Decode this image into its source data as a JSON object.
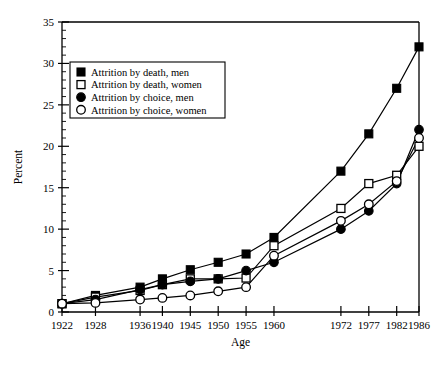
{
  "chart_data": {
    "type": "line",
    "title": "",
    "xlabel": "Age",
    "ylabel": "Percent",
    "grid": false,
    "legend_position": "upper-left-inside",
    "xlim": [
      1922,
      1986
    ],
    "ylim": [
      0,
      35
    ],
    "y_ticks_major": [
      0,
      5,
      10,
      15,
      20,
      25,
      30,
      35
    ],
    "y_tick_minor_step": 1,
    "categories": [
      1922,
      1928,
      1936,
      1940,
      1945,
      1950,
      1955,
      1960,
      1972,
      1977,
      1982,
      1986
    ],
    "x_tick_labels": [
      "1922",
      "1928",
      "1936",
      "1940",
      "1945",
      "1950",
      "1955",
      "1960",
      "1972",
      "1977",
      "1982",
      "1986"
    ],
    "series": [
      {
        "name": "Attrition by death, men",
        "marker": "filled-square",
        "values": [
          1.0,
          2.0,
          3.0,
          4.0,
          5.1,
          6.0,
          7.0,
          9.0,
          17.0,
          21.5,
          27.0,
          32.0
        ]
      },
      {
        "name": "Attrition by death, women",
        "marker": "open-square",
        "values": [
          1.0,
          1.8,
          2.6,
          3.3,
          4.0,
          4.0,
          4.1,
          8.0,
          12.5,
          15.5,
          16.5,
          20.0
        ]
      },
      {
        "name": "Attrition by choice, men",
        "marker": "filled-circle",
        "values": [
          1.0,
          1.5,
          2.7,
          3.3,
          3.7,
          4.0,
          5.0,
          6.0,
          10.0,
          12.2,
          15.5,
          22.0
        ]
      },
      {
        "name": "Attrition by choice, women",
        "marker": "open-circle",
        "values": [
          1.0,
          1.1,
          1.5,
          1.7,
          2.0,
          2.5,
          3.0,
          6.8,
          11.0,
          13.0,
          15.8,
          21.0
        ]
      }
    ]
  },
  "legend": {
    "entries": [
      {
        "label": "Attrition by death, men",
        "marker": "filled-square"
      },
      {
        "label": "Attrition by death, women",
        "marker": "open-square"
      },
      {
        "label": "Attrition by choice, men",
        "marker": "filled-circle"
      },
      {
        "label": "Attrition by choice, women",
        "marker": "open-circle"
      }
    ]
  },
  "axes": {
    "y_title": "Percent",
    "x_title": "Age",
    "y_tick_labels": [
      "0",
      "5",
      "10",
      "15",
      "20",
      "25",
      "30",
      "35"
    ],
    "x_tick_labels": [
      "1922",
      "1928",
      "1936",
      "1940",
      "1945",
      "1950",
      "1955",
      "1960",
      "1972",
      "1977",
      "1982",
      "1986"
    ]
  },
  "colors": {
    "ink": "#000000",
    "background": "#ffffff"
  }
}
